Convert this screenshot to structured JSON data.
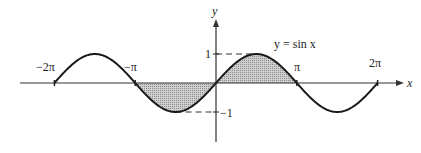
{
  "chart_data": {
    "type": "line",
    "title": "",
    "curve_label": "y = sin x",
    "xlabel": "x",
    "ylabel": "y",
    "xlim": [
      -6.9,
      7.6
    ],
    "ylim": [
      -1.9,
      2.2
    ],
    "x_ticks": [
      {
        "value": -6.2832,
        "label": "−2π"
      },
      {
        "value": -3.1416,
        "label": "−π"
      },
      {
        "value": 3.1416,
        "label": "π"
      },
      {
        "value": 6.2832,
        "label": "2π"
      }
    ],
    "y_ticks": [
      {
        "value": 1,
        "label": "1"
      },
      {
        "value": -1,
        "label": "−1"
      }
    ],
    "series": [
      {
        "name": "y = sin x",
        "function": "sin(x)",
        "x_range": [
          -6.2832,
          6.2832
        ]
      }
    ],
    "shaded_regions": [
      {
        "x_range": [
          -3.1416,
          0
        ],
        "description": "area between curve and x-axis, below axis"
      },
      {
        "x_range": [
          0,
          3.1416
        ],
        "description": "area between curve and x-axis, above axis"
      }
    ],
    "guides": [
      {
        "type": "dashed",
        "from": [
          0,
          1
        ],
        "to": [
          1.5708,
          1
        ]
      },
      {
        "type": "dashed",
        "from": [
          -1.5708,
          -1
        ],
        "to": [
          0,
          -1
        ]
      }
    ],
    "grid": false,
    "legend": "none"
  },
  "colors": {
    "curve": "#1a1a1a",
    "axis": "#333333",
    "shade": "#b8b8b8"
  }
}
